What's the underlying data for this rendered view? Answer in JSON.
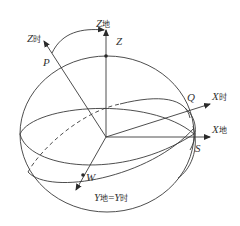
{
  "diagram": {
    "stroke_color": "#3a3a3a",
    "labels": {
      "z_shi": {
        "main": "Z",
        "sub": "时"
      },
      "z_di": {
        "main": "Z",
        "sub": "地"
      },
      "z": {
        "main": "Z"
      },
      "p": {
        "main": "P"
      },
      "q": {
        "main": "Q"
      },
      "x_shi": {
        "main": "X",
        "sub": "时"
      },
      "x_di": {
        "main": "X",
        "sub": "地"
      },
      "s": {
        "main": "S"
      },
      "w": {
        "main": "W"
      },
      "y_eq": {
        "main1": "Y",
        "sub1": "地",
        "eq": "=",
        "main2": "Y",
        "sub2": "时"
      }
    }
  }
}
